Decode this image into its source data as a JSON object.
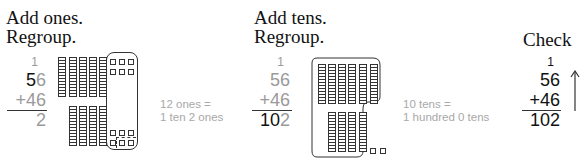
{
  "step1": {
    "heading_line1": "Add ones.",
    "heading_line2": "Regroup.",
    "carry": "1",
    "addend1": {
      "tens": "5",
      "ones": "6"
    },
    "addend2": {
      "sign": "+",
      "tens": "4",
      "ones": "6"
    },
    "sum": "2",
    "note_line1": "12 ones =",
    "note_line2": "1 ten 2 ones",
    "tens_rods_top": 5,
    "tens_rods_bottom": 4,
    "ones_cubes": 12
  },
  "step2": {
    "heading_line1": "Add tens.",
    "heading_line2": "Regroup.",
    "carry": "1",
    "addend1": "56",
    "addend2": {
      "sign": "+",
      "value": "46"
    },
    "sum": {
      "hundreds_tens": "10",
      "ones": "2"
    },
    "note_line1": "10 tens =",
    "note_line2": "1 hundred 0 tens",
    "tens_rods_top": 6,
    "tens_rods_bottom": 4,
    "ones_cubes": 2
  },
  "step3": {
    "heading": "Check",
    "carry": "1",
    "addend1": "56",
    "addend2": {
      "sign": "+",
      "value": "46"
    },
    "sum": "102",
    "arrow": "up-arrow"
  }
}
